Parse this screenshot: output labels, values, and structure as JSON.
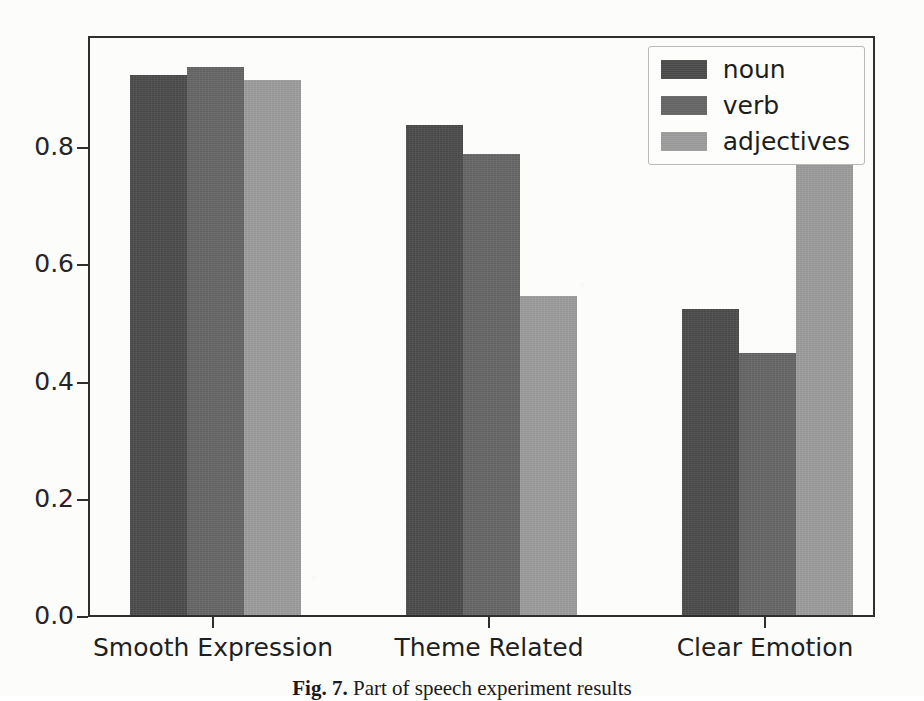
{
  "figure": {
    "caption_label": "Fig. 7.",
    "caption_text": "Part of speech experiment results"
  },
  "chart_data": {
    "type": "bar",
    "title": "",
    "xlabel": "",
    "ylabel": "",
    "categories": [
      "Smooth Expression",
      "Theme Related",
      "Clear Emotion"
    ],
    "series": [
      {
        "name": "noun",
        "color": "#4c4c4c",
        "values": [
          0.922,
          0.836,
          0.522
        ]
      },
      {
        "name": "verb",
        "color": "#666666",
        "values": [
          0.936,
          0.787,
          0.447
        ]
      },
      {
        "name": "adjectives",
        "color": "#9d9d9d",
        "values": [
          0.913,
          0.545,
          0.777
        ]
      }
    ],
    "ylim": [
      0.0,
      0.96
    ],
    "yticks": [
      0.0,
      0.2,
      0.4,
      0.6,
      0.8
    ],
    "ytick_labels": [
      "0.0",
      "0.2",
      "0.4",
      "0.6",
      "0.8"
    ],
    "grid": false,
    "legend_position": "upper right"
  }
}
